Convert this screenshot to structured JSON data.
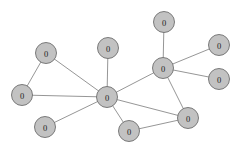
{
  "figure": {
    "name": "network-graph",
    "background_color": "#ffffff",
    "width": 245,
    "height": 151
  },
  "chart_data": {
    "type": "diagram",
    "subtype": "node-link-graph",
    "title": "",
    "xlabel": "",
    "ylabel": "",
    "grid": false,
    "legend": null,
    "directed": false,
    "node_count": 11,
    "edge_count": 13,
    "style": {
      "node_fill": "#c2c2c2",
      "node_stroke": "#6e6e6e",
      "node_radius": 10.5,
      "edge_color": "#8a8a8a",
      "edge_width": 0.9,
      "label_color": "#1c1c1c"
    },
    "nodes": [
      {
        "id": "n0",
        "label": "0",
        "x": 46,
        "y": 53,
        "name": "node-upper-left"
      },
      {
        "id": "n1",
        "label": "0",
        "x": 22,
        "y": 95,
        "name": "node-far-left"
      },
      {
        "id": "n2",
        "label": "0",
        "x": 108,
        "y": 48,
        "name": "node-top-center"
      },
      {
        "id": "n3",
        "label": "0",
        "x": 107,
        "y": 97,
        "name": "node-center-hub"
      },
      {
        "id": "n4",
        "label": "0",
        "x": 45,
        "y": 127,
        "name": "node-lower-left"
      },
      {
        "id": "n5",
        "label": "0",
        "x": 164,
        "y": 22,
        "name": "node-top-right"
      },
      {
        "id": "n6",
        "label": "0",
        "x": 163,
        "y": 68,
        "name": "node-right-hub"
      },
      {
        "id": "n7",
        "label": "0",
        "x": 219,
        "y": 45,
        "name": "node-far-right-upper"
      },
      {
        "id": "n8",
        "label": "0",
        "x": 219,
        "y": 79,
        "name": "node-far-right-lower"
      },
      {
        "id": "n9",
        "label": "0",
        "x": 188,
        "y": 118,
        "name": "node-bottom-right"
      },
      {
        "id": "n10",
        "label": "0",
        "x": 129,
        "y": 131,
        "name": "node-bottom-center"
      }
    ],
    "edges": [
      {
        "source": "n0",
        "target": "n1",
        "name": "edge-upper-left-far-left"
      },
      {
        "source": "n0",
        "target": "n3",
        "name": "edge-upper-left-center-hub"
      },
      {
        "source": "n1",
        "target": "n3",
        "name": "edge-far-left-center-hub"
      },
      {
        "source": "n2",
        "target": "n3",
        "name": "edge-top-center-center-hub"
      },
      {
        "source": "n3",
        "target": "n4",
        "name": "edge-center-hub-lower-left"
      },
      {
        "source": "n3",
        "target": "n6",
        "name": "edge-center-hub-right-hub"
      },
      {
        "source": "n3",
        "target": "n10",
        "name": "edge-center-hub-bottom-center"
      },
      {
        "source": "n5",
        "target": "n6",
        "name": "edge-top-right-right-hub"
      },
      {
        "source": "n6",
        "target": "n7",
        "name": "edge-right-hub-far-right-upper"
      },
      {
        "source": "n6",
        "target": "n8",
        "name": "edge-right-hub-far-right-lower"
      },
      {
        "source": "n6",
        "target": "n9",
        "name": "edge-right-hub-bottom-right"
      },
      {
        "source": "n9",
        "target": "n10",
        "name": "edge-bottom-right-bottom-center"
      },
      {
        "source": "n3",
        "target": "n9",
        "name": "edge-center-hub-bottom-right-stub"
      }
    ]
  }
}
